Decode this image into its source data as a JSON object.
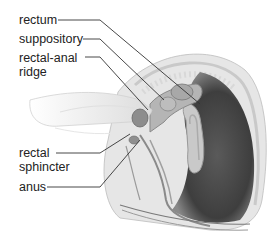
{
  "figure": {
    "labels": [
      {
        "id": "rectum",
        "lines": [
          "rectum"
        ]
      },
      {
        "id": "suppository",
        "lines": [
          "suppository"
        ]
      },
      {
        "id": "rectal-anal-ridge",
        "lines": [
          "rectal-anal",
          "ridge"
        ]
      },
      {
        "id": "rectal-sphincter",
        "lines": [
          "rectal",
          "sphincter"
        ]
      },
      {
        "id": "anus",
        "lines": [
          "anus"
        ]
      }
    ]
  },
  "colors": {
    "background": "#ffffff",
    "text": "#222222",
    "leader": "#333333",
    "tissue_light": "#e4e4e4",
    "tissue_mid": "#b5b5b5",
    "cavity_dark": "#4a4a4a"
  }
}
